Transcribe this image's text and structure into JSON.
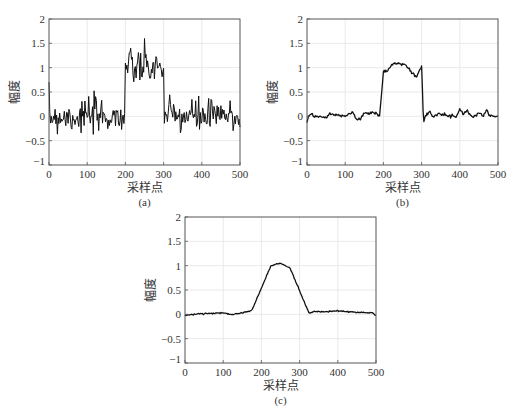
{
  "chart_data": [
    {
      "type": "line",
      "panel": "a",
      "caption": "(a)",
      "title": "",
      "xlabel": "采样点",
      "ylabel": "幅度",
      "xlim": [
        0,
        500
      ],
      "ylim": [
        -1,
        2
      ],
      "xticks": [
        0,
        100,
        200,
        300,
        400,
        500
      ],
      "yticks": [
        -1,
        -0.5,
        0,
        0.5,
        1,
        1.5,
        2
      ],
      "ytick_labels": [
        "−1",
        "−0.5",
        "0",
        "0.5",
        "1",
        "1.5",
        "2"
      ],
      "grid": true,
      "description": "Noisy rectangular pulse: baseline ~0 with noise ±0.4 for samples 0–200 and 300–500; plateau ~1.0 (noise 0.5–1.6) for samples 200–300; peak ~1.6 near 250.",
      "series": [
        {
          "name": "noisy signal",
          "x": [
            0,
            200,
            200,
            250,
            300,
            300,
            500
          ],
          "values": [
            0,
            0,
            1.0,
            1.6,
            1.0,
            0,
            0
          ]
        }
      ]
    },
    {
      "type": "line",
      "panel": "b",
      "caption": "(b)",
      "title": "",
      "xlabel": "采样点",
      "ylabel": "幅度",
      "xlim": [
        0,
        500
      ],
      "ylim": [
        -1,
        2
      ],
      "xticks": [
        0,
        100,
        200,
        300,
        400,
        500
      ],
      "yticks": [
        -1,
        -0.5,
        0,
        0.5,
        1,
        1.5,
        2
      ],
      "ytick_labels": [
        "−1",
        "−0.5",
        "0",
        "0.5",
        "1",
        "1.5",
        "2"
      ],
      "grid": true,
      "description": "Lightly smoothed pulse: baseline ~0 (±0.15), rises at ~190–205 to ~0.95, plateau ~1.05–1.1 around 230–250, dips to ~0.8 near 285, back to ~1.0 at 300, drops to ~-0.12 at ~305.",
      "series": [
        {
          "name": "filtered signal",
          "x": [
            0,
            5,
            10,
            20,
            50,
            60,
            70,
            100,
            120,
            130,
            140,
            150,
            160,
            170,
            180,
            190,
            200,
            205,
            210,
            220,
            240,
            260,
            280,
            285,
            295,
            300,
            305,
            310,
            320,
            330,
            350,
            370,
            390,
            400,
            410,
            420,
            430,
            440,
            450,
            460,
            470,
            480,
            500
          ],
          "values": [
            -0.12,
            0.02,
            0.05,
            0,
            -0.02,
            0.05,
            0.03,
            0.02,
            0.08,
            -0.08,
            -0.05,
            0.08,
            0.05,
            0.08,
            0.07,
            0.0,
            0.9,
            0.95,
            0.92,
            1.05,
            1.1,
            1.05,
            0.85,
            0.8,
            0.95,
            1.0,
            -0.12,
            0.0,
            0.1,
            0.0,
            0.08,
            0.0,
            0.0,
            0.15,
            0.05,
            0.12,
            0.0,
            0.0,
            0.08,
            0.0,
            0.13,
            0.0,
            0.0
          ]
        }
      ]
    },
    {
      "type": "line",
      "panel": "c",
      "caption": "(c)",
      "title": "",
      "xlabel": "采样点",
      "ylabel": "幅度",
      "xlim": [
        0,
        500
      ],
      "ylim": [
        -1,
        2
      ],
      "xticks": [
        0,
        100,
        200,
        300,
        400,
        500
      ],
      "yticks": [
        -1,
        -0.5,
        0,
        0.5,
        1,
        1.5,
        2
      ],
      "ytick_labels": [
        "−1",
        "−0.5",
        "0",
        "0.5",
        "1",
        "1.5",
        "2"
      ],
      "grid": true,
      "description": "Heavily smoothed trapezoidal pulse: baseline ~0, ramps from ~0.08 at 175 up to ~1.0 at 225, peak ~1.05 at 250, ~0.95 at 275, down to ~0.02 at 325, then ~0.05 to 500.",
      "series": [
        {
          "name": "smoothed signal",
          "x": [
            0,
            25,
            50,
            75,
            100,
            120,
            150,
            175,
            225,
            250,
            275,
            325,
            340,
            360,
            400,
            450,
            490,
            500
          ],
          "values": [
            -0.02,
            0.0,
            0.02,
            0.02,
            0.03,
            0.0,
            0.03,
            0.08,
            1.0,
            1.05,
            0.95,
            0.02,
            0.06,
            0.05,
            0.07,
            0.04,
            0.03,
            -0.02
          ]
        }
      ]
    }
  ]
}
